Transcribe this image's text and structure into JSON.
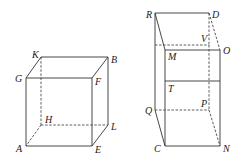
{
  "figures": [
    {
      "name": "cube",
      "vertices": {
        "K": [
          41,
          57
        ],
        "B": [
          108,
          57
        ],
        "G": [
          26,
          78
        ],
        "F": [
          92,
          78
        ],
        "H": [
          41,
          125
        ],
        "L": [
          108,
          125
        ],
        "A": [
          26,
          146
        ],
        "E": [
          92,
          146
        ]
      },
      "solid_edges": [
        [
          "K",
          "B"
        ],
        [
          "G",
          "F"
        ],
        [
          "G",
          "K"
        ],
        [
          "F",
          "B"
        ],
        [
          "G",
          "A"
        ],
        [
          "F",
          "E"
        ],
        [
          "B",
          "L"
        ],
        [
          "A",
          "E"
        ],
        [
          "E",
          "L"
        ]
      ],
      "dashed_edges": [
        [
          "K",
          "H"
        ],
        [
          "H",
          "L"
        ],
        [
          "H",
          "A"
        ]
      ],
      "labels": [
        {
          "text": "K",
          "x": 32,
          "y": 58
        },
        {
          "text": "B",
          "x": 111,
          "y": 63
        },
        {
          "text": "G",
          "x": 15,
          "y": 82
        },
        {
          "text": "F",
          "x": 95,
          "y": 85
        },
        {
          "text": "H",
          "x": 45,
          "y": 123
        },
        {
          "text": "L",
          "x": 111,
          "y": 130
        },
        {
          "text": "A",
          "x": 16,
          "y": 152
        },
        {
          "text": "E",
          "x": 95,
          "y": 153
        }
      ]
    },
    {
      "name": "prism",
      "vertices": {
        "R": [
          155,
          13
        ],
        "D": [
          209,
          13
        ],
        "RB": [
          155,
          45
        ],
        "V": [
          209,
          45
        ],
        "M": [
          165,
          50
        ],
        "O": [
          220,
          50
        ],
        "T": [
          165,
          81
        ],
        "TO": [
          220,
          81
        ],
        "Q": [
          155,
          110
        ],
        "P": [
          209,
          110
        ],
        "C": [
          165,
          146
        ],
        "N": [
          220,
          146
        ]
      },
      "solid_edges": [
        [
          "R",
          "D"
        ],
        [
          "R",
          "M"
        ],
        [
          "R",
          "Q"
        ],
        [
          "M",
          "O"
        ],
        [
          "M",
          "C"
        ],
        [
          "O",
          "N"
        ],
        [
          "T",
          "TO"
        ],
        [
          "C",
          "N"
        ],
        [
          "Q",
          "C"
        ]
      ],
      "dashed_edges": [
        [
          "RB",
          "V"
        ],
        [
          "D",
          "O"
        ],
        [
          "V",
          "P"
        ],
        [
          "D",
          "V"
        ],
        [
          "Q",
          "P"
        ],
        [
          "P",
          "N"
        ]
      ],
      "labels": [
        {
          "text": "R",
          "x": 146,
          "y": 18
        },
        {
          "text": "D",
          "x": 212,
          "y": 18
        },
        {
          "text": "V",
          "x": 201,
          "y": 42
        },
        {
          "text": "O",
          "x": 223,
          "y": 54
        },
        {
          "text": "M",
          "x": 168,
          "y": 60
        },
        {
          "text": "T",
          "x": 168,
          "y": 92
        },
        {
          "text": "Q",
          "x": 145,
          "y": 114
        },
        {
          "text": "P",
          "x": 201,
          "y": 107
        },
        {
          "text": "C",
          "x": 154,
          "y": 152
        },
        {
          "text": "N",
          "x": 223,
          "y": 152
        }
      ]
    }
  ]
}
